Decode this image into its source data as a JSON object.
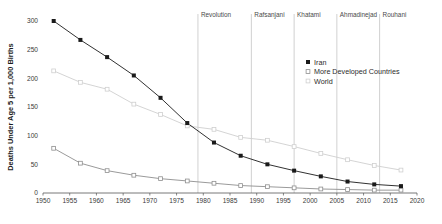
{
  "chart_data": {
    "type": "line",
    "title": "",
    "xlabel": "",
    "ylabel": "Deaths Under Age 5 per 1,000 Births",
    "xlim": [
      1950,
      2020
    ],
    "ylim": [
      0,
      300
    ],
    "grid": false,
    "legend_position": "inside-upper-right",
    "x": [
      1952,
      1957,
      1962,
      1967,
      1972,
      1977,
      1982,
      1987,
      1992,
      1997,
      2002,
      2007,
      2012,
      2017
    ],
    "xticks": [
      "1950",
      "1955",
      "1960",
      "1965",
      "1970",
      "1975",
      "1980",
      "1985",
      "1990",
      "1995",
      "2000",
      "2005",
      "2010",
      "2015",
      "2020"
    ],
    "xtick_values": [
      1950,
      1955,
      1960,
      1965,
      1970,
      1975,
      1980,
      1985,
      1990,
      1995,
      2000,
      2005,
      2010,
      2015,
      2020
    ],
    "yticks": [
      "0",
      "50",
      "100",
      "150",
      "200",
      "250",
      "300"
    ],
    "ytick_values": [
      0,
      50,
      100,
      150,
      200,
      250,
      300
    ],
    "series": [
      {
        "name": "Iran",
        "marker": "filled-square",
        "color": "#1a1a1a",
        "values": [
          300,
          267,
          237,
          205,
          166,
          122,
          88,
          65,
          50,
          39,
          29,
          20,
          15,
          12
        ]
      },
      {
        "name": "More Developed Countries",
        "marker": "open-square",
        "color": "#8e8e8e",
        "values": [
          78,
          52,
          39,
          31,
          25,
          21,
          17,
          13,
          11,
          9,
          7,
          6,
          5,
          5
        ]
      },
      {
        "name": "World",
        "marker": "open-square-light",
        "color": "#cfcfcf",
        "values": [
          213,
          193,
          181,
          155,
          137,
          117,
          111,
          97,
          92,
          81,
          69,
          58,
          48,
          40
        ]
      }
    ],
    "annotations": [
      {
        "label": "Revolution",
        "x": 1979
      },
      {
        "label": "Rafsanjani",
        "x": 1989
      },
      {
        "label": "Khatami",
        "x": 1997
      },
      {
        "label": "Ahmadinejad",
        "x": 2005
      },
      {
        "label": "Rouhani",
        "x": 2013
      }
    ],
    "annotation_line_color": "#bdbdbd",
    "axis_color": "#555555"
  }
}
